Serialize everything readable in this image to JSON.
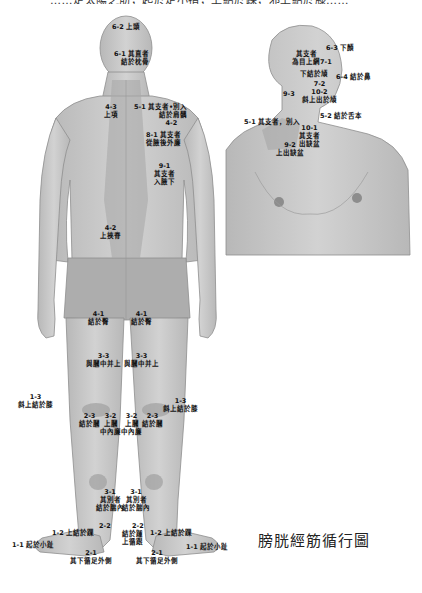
{
  "header": {
    "title_cut": "……足太陽之筋，起於足小指，上結於踝，邪上結於膝……"
  },
  "caption": "膀胱經筋循行圖",
  "colors": {
    "skin": "#c9c9c9",
    "skin_dark": "#a9a9a9",
    "meridian_band": "#b3b3b3",
    "shorts": "#aeaeae",
    "text": "#111111"
  },
  "back_labels": [
    {
      "id": "6-2",
      "line1": "6-2 上頭",
      "line2": ""
    },
    {
      "id": "6-1",
      "line1": "6-1  其直者",
      "line2": "結於枕骨"
    },
    {
      "id": "4-3",
      "line1": "4-3",
      "line2": "上項"
    },
    {
      "id": "5-1",
      "line1": "5-1 其支者•別入",
      "line2": "結於肩髃"
    },
    {
      "id": "4-2b",
      "line1": "4-2",
      "line2": ""
    },
    {
      "id": "8-1",
      "line1": "8-1  其支者",
      "line2": "從腋後外廉"
    },
    {
      "id": "9-1",
      "line1": "9-1",
      "line2": "其支者",
      "line3": "入腋下"
    },
    {
      "id": "4-2",
      "line1": "4-2",
      "line2": "上挾脊"
    },
    {
      "id": "4-1L",
      "line1": "4-1",
      "line2": "結於臀"
    },
    {
      "id": "4-1R",
      "line1": "4-1",
      "line2": "結於臀"
    },
    {
      "id": "3-3L",
      "line1": "3-3",
      "line2": "與膕中并上"
    },
    {
      "id": "3-3R",
      "line1": "3-3",
      "line2": "與膕中并上"
    },
    {
      "id": "1-3L",
      "line1": "1-3",
      "line2": "斜上結於膝"
    },
    {
      "id": "1-3R",
      "line1": "1-3",
      "line2": "斜上結於膝"
    },
    {
      "id": "2-3L",
      "line1": "2-3",
      "line2": "結於膕"
    },
    {
      "id": "3-2L",
      "line1": "3-2",
      "line2": "上膕",
      "line3": "中內廉"
    },
    {
      "id": "3-2R",
      "line1": "3-2",
      "line2": "上膕",
      "line3": "中內廉"
    },
    {
      "id": "2-3R",
      "line1": "2-3",
      "line2": "結於膕"
    },
    {
      "id": "3-1L",
      "line1": "3-1",
      "line2": "其別者",
      "line3": "結於腨內"
    },
    {
      "id": "3-1R",
      "line1": "3-1",
      "line2": "其別者",
      "line3": "結於腨內"
    },
    {
      "id": "2-2L",
      "line1": "2-2",
      "line2": ""
    },
    {
      "id": "2-2R",
      "line1": "2-2",
      "line2": "結於踵",
      "line3": "上循跟"
    },
    {
      "id": "1-2L",
      "line1": "1-2 上結於踝",
      "line2": ""
    },
    {
      "id": "1-2R",
      "line1": "1-2 上結於踝",
      "line2": ""
    },
    {
      "id": "1-1L",
      "line1": "1-1 起於小趾",
      "line2": ""
    },
    {
      "id": "1-1R",
      "line1": "1-1 起於小趾",
      "line2": ""
    },
    {
      "id": "2-1L",
      "line1": "2-1",
      "line2": "其下循足外側"
    },
    {
      "id": "2-1R",
      "line1": "2-1",
      "line2": "其下循足外側"
    }
  ],
  "front_labels": [
    {
      "id": "6-3",
      "line1": "6-3 下顏"
    },
    {
      "id": "7-1",
      "line1": "其支者",
      "line2": "為目上網7-1"
    },
    {
      "id": "7-2a",
      "line1": "下結於頄"
    },
    {
      "id": "6-4",
      "line1": "6-4 結於鼻"
    },
    {
      "id": "7-2",
      "line1": "7-2",
      "line2": "10-2",
      "line3": "斜上出於頄"
    },
    {
      "id": "9-3",
      "line1": "9-3"
    },
    {
      "id": "5-2",
      "line1": "5-2 結於舌本"
    },
    {
      "id": "5-1f",
      "line1": "5-1 其支者，別入"
    },
    {
      "id": "10-1",
      "line1": "10-1",
      "line2": "其支者",
      "line3": "出缺盆"
    },
    {
      "id": "9-2",
      "line1": "9-2",
      "line2": "上出缺盆"
    }
  ]
}
